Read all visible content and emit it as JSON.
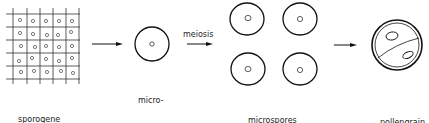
{
  "stages": [
    {
      "id": "sporogene",
      "label_lines": [
        "sporogene",
        "tissue"
      ]
    },
    {
      "id": "mother-cell",
      "label_lines": [
        "micro-",
        "spore",
        "mother",
        "cell"
      ]
    },
    {
      "id": "microspores",
      "label_lines": [
        "microspores",
        "(tetrade)"
      ]
    },
    {
      "id": "pollengrain",
      "label_lines": [
        "pollengrain"
      ]
    }
  ],
  "arrows": [
    {
      "from": "sporogene",
      "to": "mother-cell",
      "label": ""
    },
    {
      "from": "mother-cell",
      "to": "microspores",
      "label": "meiosis"
    },
    {
      "from": "microspores",
      "to": "pollengrain",
      "label": ""
    }
  ],
  "colors": {
    "stroke": "#1a1a1a",
    "background": "#ffffff"
  }
}
